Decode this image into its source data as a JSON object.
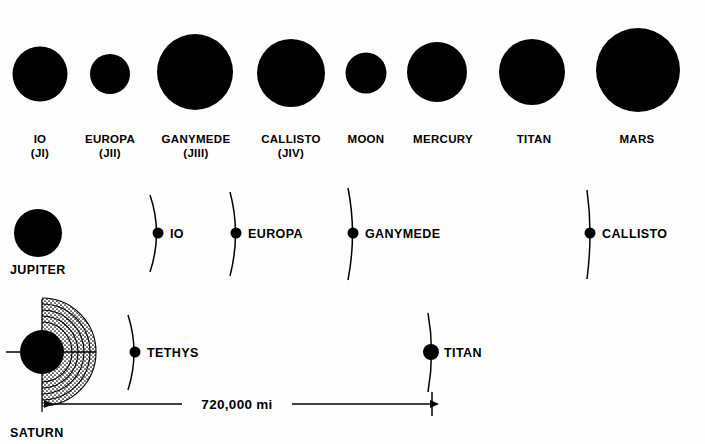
{
  "figure": {
    "background_color": "#ffffff",
    "ink_color": "#000000"
  },
  "size_comparison_row": {
    "name": "relative-size-comparison",
    "baseline_y": 75,
    "label_line1_y": 139,
    "label_line2_y": 153,
    "bodies": [
      {
        "name": "IO",
        "designation": "(JI)",
        "cx": 40,
        "cy": 74,
        "r": 27.5
      },
      {
        "name": "EUROPA",
        "designation": "(JII)",
        "cx": 110,
        "cy": 74,
        "r": 20.0
      },
      {
        "name": "GANYMEDE",
        "designation": "(JIII)",
        "cx": 195,
        "cy": 72,
        "r": 38.0
      },
      {
        "name": "CALLISTO",
        "designation": "(JIV)",
        "cx": 291,
        "cy": 73,
        "r": 34.0
      },
      {
        "name": "MOON",
        "designation": "",
        "cx": 366,
        "cy": 73,
        "r": 20.5
      },
      {
        "name": "MERCURY",
        "designation": "",
        "cx": 437,
        "cy": 72,
        "r": 30.0
      },
      {
        "name": "TITAN",
        "designation": "",
        "cx": 532,
        "cy": 72,
        "r": 33.0
      },
      {
        "name": "MARS",
        "designation": "",
        "cx": 638,
        "cy": 70,
        "r": 42.0
      }
    ]
  },
  "jupiter_system_row": {
    "name": "jupiter-orbit-row",
    "primary": {
      "label": "JUPITER",
      "cx": 38,
      "cy": 233,
      "r": 24,
      "label_x": 10,
      "label_y": 274
    },
    "orbit_center_y": 233,
    "satellites": [
      {
        "label": "IO",
        "dot_x": 158,
        "dot_r": 5.5,
        "arc_x": 158,
        "label_x": 170
      },
      {
        "label": "EUROPA",
        "dot_x": 236,
        "dot_r": 5.5,
        "arc_x": 236,
        "label_x": 248
      },
      {
        "label": "GANYMEDE",
        "dot_x": 353,
        "dot_r": 5.5,
        "arc_x": 353,
        "label_x": 365
      },
      {
        "label": "CALLISTO",
        "dot_x": 590,
        "dot_r": 5.5,
        "arc_x": 590,
        "label_x": 602
      }
    ]
  },
  "saturn_system_row": {
    "name": "saturn-orbit-row",
    "primary": {
      "label": "SATURN",
      "cx": 42,
      "cy": 352,
      "r": 22,
      "label_x": 10,
      "label_y": 437
    },
    "rings": {
      "name": "saturn-rings",
      "band_radii": [
        30,
        36,
        42,
        48,
        54
      ],
      "fill_shade": "#d9d9d9"
    },
    "orbit_center_y": 352,
    "satellites": [
      {
        "label": "TETHYS",
        "dot_x": 135,
        "dot_r": 5.5,
        "arc_x": 135,
        "label_x": 147
      },
      {
        "label": "TITAN",
        "dot_x": 431,
        "dot_r": 8.0,
        "arc_x": 431,
        "label_x": 444
      }
    ],
    "dimension": {
      "name": "orbit-distance-dimension",
      "value_label": "720,000 mi",
      "start_x": 42,
      "end_x": 432,
      "y": 404,
      "label_x": 237,
      "label_y": 399
    }
  }
}
